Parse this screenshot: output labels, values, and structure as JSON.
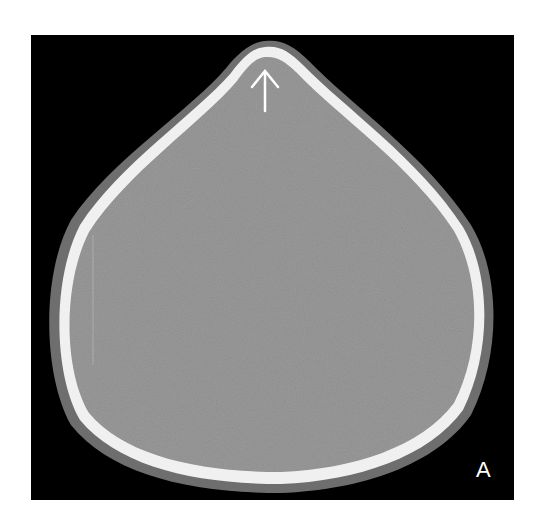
{
  "figure": {
    "panel_label": "A",
    "modality": "axial CT slice (brain window)",
    "annotation": {
      "type": "arrow",
      "direction": "up",
      "color": "#ffffff",
      "target": "anterior skull vertex"
    },
    "colors": {
      "background": "#000000",
      "page": "#ffffff",
      "bone": "#f2f2f2",
      "soft_tissue": "#8c8c8c",
      "scalp": "#6e6e6e"
    }
  }
}
